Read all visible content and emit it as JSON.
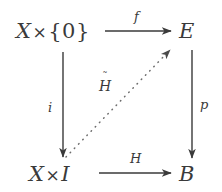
{
  "diagram": {
    "kind": "commutative-diagram",
    "background_color": "#ffffff",
    "ink_color": "#3a3a3a",
    "nodes": [
      {
        "id": "top-left",
        "base": "X",
        "op": "×",
        "arg": "{0}"
      },
      {
        "id": "top-right",
        "base": "E",
        "op": "",
        "arg": ""
      },
      {
        "id": "bottom-left",
        "base": "X",
        "op": "×",
        "arg": "I"
      },
      {
        "id": "bottom-right",
        "base": "B",
        "op": "",
        "arg": ""
      }
    ],
    "arrows": [
      {
        "id": "top",
        "label": "f",
        "style": "solid",
        "direction": "right"
      },
      {
        "id": "left",
        "label": "i",
        "style": "solid",
        "direction": "down"
      },
      {
        "id": "right",
        "label": "p",
        "style": "solid",
        "direction": "down"
      },
      {
        "id": "bottom",
        "label": "H",
        "style": "solid",
        "direction": "right"
      },
      {
        "id": "diagonal",
        "label": "H",
        "accent": "˜",
        "style": "dotted",
        "direction": "up-right"
      }
    ]
  }
}
